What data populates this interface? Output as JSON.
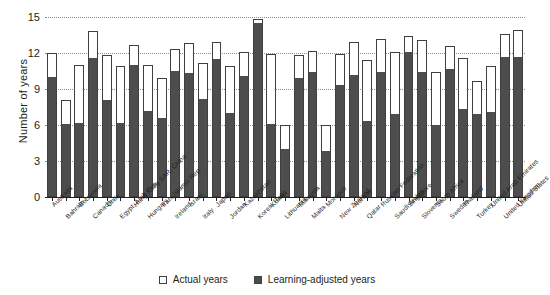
{
  "axes": {
    "ylabel": "Number of years",
    "yticks": [
      "0",
      "3",
      "6",
      "9",
      "12",
      "15"
    ]
  },
  "legend": {
    "items": [
      {
        "label": "Actual years",
        "swatch": "actual",
        "color": "#ffffff"
      },
      {
        "label": "Learning-adjusted years",
        "swatch": "learning",
        "color": "#4d4d4d"
      }
    ]
  },
  "chart_data": {
    "type": "bar",
    "stacked": true,
    "title": "",
    "xlabel": "",
    "ylabel": "Number of years",
    "ylim": [
      0,
      15
    ],
    "yticks": [
      0,
      3,
      6,
      9,
      12,
      15
    ],
    "grid": true,
    "legend_position": "bottom-center",
    "categories": [
      "Australia",
      "Bahrain",
      "Botswana",
      "Canada",
      "Chile",
      "Egypt, Arab Rep.",
      "Hong Kong SAR, China",
      "Hungary",
      "Iran, Islamic Rep.",
      "Ireland",
      "Israel",
      "Italy",
      "Japan",
      "Jordan",
      "Kazakhstan",
      "Korea, Rep.",
      "Kuwait",
      "Lithuania",
      "Malaysia",
      "Malta",
      "Morocco",
      "New Zealand",
      "Norway",
      "Qatar",
      "Russian Federation",
      "Saudi Arabia",
      "Singapore",
      "Slovenia",
      "South Africa",
      "Sweden",
      "Thailand",
      "Turkey",
      "United Arab Emirates",
      "United Kingdom",
      "United States"
    ],
    "series": [
      {
        "name": "Learning-adjusted years",
        "values": [
          10.0,
          6.1,
          6.2,
          11.6,
          8.1,
          6.2,
          11.0,
          7.2,
          6.6,
          10.5,
          10.3,
          8.2,
          11.5,
          7.0,
          10.1,
          14.5,
          6.1,
          4.0,
          9.9,
          10.4,
          3.8,
          9.3,
          10.2,
          6.3,
          10.4,
          6.9,
          12.1,
          10.4,
          6.0,
          10.7,
          7.3,
          6.9,
          7.1,
          11.7,
          11.7
        ]
      },
      {
        "name": "Actual years",
        "values": [
          12.0,
          8.1,
          11.0,
          13.8,
          11.8,
          10.9,
          12.7,
          11.0,
          9.9,
          12.3,
          12.8,
          11.2,
          12.9,
          10.9,
          12.1,
          14.8,
          11.9,
          6.0,
          11.8,
          12.2,
          6.0,
          11.9,
          12.9,
          11.4,
          13.2,
          12.1,
          13.4,
          13.1,
          10.4,
          12.6,
          11.6,
          9.7,
          10.9,
          13.6,
          13.9
        ]
      }
    ],
    "note": "Each bar is stacked: dark segment = learning-adjusted years (bottom), white segment = remainder up to actual years (top)."
  }
}
